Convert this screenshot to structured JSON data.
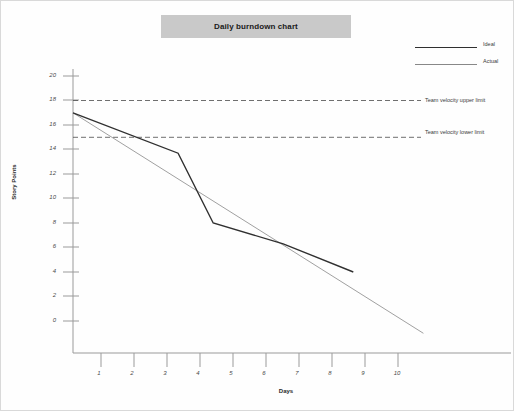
{
  "chart": {
    "title": "Daily burndown chart",
    "legend": [
      {
        "label": "Ideal",
        "icon": "line-swatch-icon",
        "color": "#303030"
      },
      {
        "label": "Actual",
        "icon": "line-swatch-icon",
        "color": "#888888"
      }
    ],
    "reference_lines": [
      {
        "label": "Team velocity upper limit",
        "value": 18
      },
      {
        "label": "Team velocity lower limit",
        "value": 15
      }
    ]
  },
  "chart_data": {
    "type": "line",
    "title": "Daily burndown chart",
    "xlabel": "Days",
    "ylabel": "Story Points",
    "xlim": [
      0,
      12.5
    ],
    "ylim": [
      -2,
      21
    ],
    "xticks": [
      1,
      2,
      3,
      4,
      5,
      6,
      7,
      8,
      9,
      10
    ],
    "yticks": [
      0,
      2,
      4,
      6,
      8,
      10,
      12,
      14,
      16,
      18,
      20
    ],
    "grid": false,
    "legend_position": "top-right",
    "series": [
      {
        "name": "Ideal",
        "color": "#303030",
        "style": "solid",
        "width": 1.4,
        "x": [
          0,
          3,
          4,
          6,
          8
        ],
        "values": [
          17,
          13.7,
          8,
          6.3,
          4
        ]
      },
      {
        "name": "Actual",
        "color": "#888888",
        "style": "solid",
        "width": 0.8,
        "x": [
          0,
          10
        ],
        "values": [
          17,
          -1
        ]
      }
    ],
    "annotations": [
      {
        "text": "Team velocity upper limit",
        "y": 18,
        "style": "dashed-horizontal-line"
      },
      {
        "text": "Team velocity lower limit",
        "y": 15,
        "style": "dashed-horizontal-line"
      }
    ]
  },
  "yticks": [
    {
      "label": "20"
    },
    {
      "label": "18"
    },
    {
      "label": "16"
    },
    {
      "label": "14"
    },
    {
      "label": "12"
    },
    {
      "label": "10"
    },
    {
      "label": "8"
    },
    {
      "label": "6"
    },
    {
      "label": "4"
    },
    {
      "label": "2"
    },
    {
      "label": "0"
    }
  ],
  "xticks": [
    {
      "label": "1"
    },
    {
      "label": "2"
    },
    {
      "label": "3"
    },
    {
      "label": "4"
    },
    {
      "label": "5"
    },
    {
      "label": "6"
    },
    {
      "label": "7"
    },
    {
      "label": "8"
    },
    {
      "label": "9"
    },
    {
      "label": "10"
    }
  ]
}
